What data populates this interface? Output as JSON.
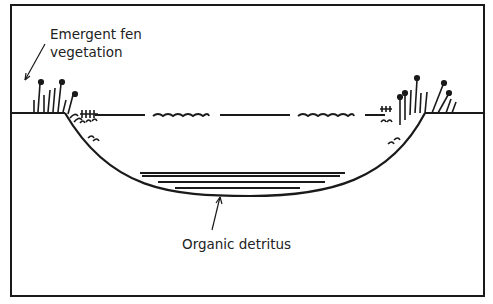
{
  "diagram": {
    "type": "cross-section",
    "labels": {
      "vegetation_line1": "Emergent fen",
      "vegetation_line2": "vegetation",
      "detritus": "Organic detritus"
    },
    "colors": {
      "ink": "#1a1a1a",
      "background": "#ffffff"
    }
  }
}
